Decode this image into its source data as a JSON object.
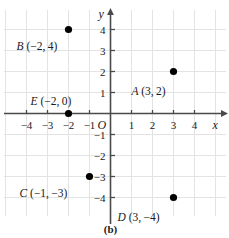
{
  "caption": "(b)",
  "chart_data": {
    "type": "scatter",
    "title": "",
    "subtitle": "",
    "xlabel": "x",
    "ylabel": "y",
    "origin_label": "O",
    "xlim": [
      -4.6,
      4.9
    ],
    "ylim": [
      -4.7,
      4.7
    ],
    "grid": true,
    "grid_color": "#e3e3e3",
    "axis_color": "#4a4a4a",
    "point_color": "#000000",
    "legend": "none",
    "xticks": [
      -4,
      -3,
      -2,
      -1,
      1,
      2,
      3,
      4
    ],
    "yticks": [
      4,
      3,
      2,
      1,
      -1,
      -2,
      -3,
      -4
    ],
    "xtick_labels": [
      "−4",
      "−3",
      "−2",
      "−1",
      "1",
      "2",
      "3",
      "4"
    ],
    "ytick_labels": [
      "4",
      "3",
      "2",
      "1",
      "−1",
      "−2",
      "−3",
      "−4"
    ],
    "points": [
      {
        "name": "A",
        "x": 3,
        "y": 2,
        "label_name": "A",
        "label_coords": "(3, 2)",
        "label_full": "A (3, 2)",
        "label_dx": -42,
        "label_dy": 14
      },
      {
        "name": "B",
        "x": -2,
        "y": 4,
        "label_name": "B",
        "label_coords": "(−2, 4)",
        "label_full": "B (−2, 4)",
        "label_dx": -52,
        "label_dy": 11
      },
      {
        "name": "C",
        "x": -1,
        "y": -3,
        "label_name": "C",
        "label_coords": "(−1, −3)",
        "label_full": "C (−1, −3)",
        "label_dx": -70,
        "label_dy": 11
      },
      {
        "name": "D",
        "x": 3,
        "y": -4,
        "label_name": "D",
        "label_coords": "(3, −4)",
        "label_full": "D (3, −4)",
        "label_dx": -56,
        "label_dy": 14
      },
      {
        "name": "E",
        "x": -2,
        "y": 0,
        "label_name": "E",
        "label_coords": "(−2, 0)",
        "label_full": "E (−2, 0)",
        "label_dx": -38,
        "label_dy": -18
      }
    ]
  }
}
